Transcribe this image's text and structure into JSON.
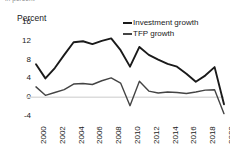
{
  "figure": {
    "clipped_caption": "in percent",
    "axis_title": "Percent",
    "background_color": "#ffffff"
  },
  "legend": {
    "position": "top-right",
    "entries": [
      {
        "label": "Investment growth",
        "color": "#1a1a1a"
      },
      {
        "label": "TFP growth",
        "color": "#444444"
      }
    ]
  },
  "chart_data": {
    "type": "line",
    "title": "",
    "subtitle": "",
    "xlabel": "",
    "ylabel": "Percent",
    "ylim": [
      -4,
      16
    ],
    "xlim": [
      2000,
      2020
    ],
    "yticks": [
      16,
      12,
      8,
      4,
      0,
      -4
    ],
    "xticks": [
      2000,
      2002,
      2004,
      2006,
      2008,
      2010,
      2012,
      2014,
      2016,
      2018,
      2020
    ],
    "grid": false,
    "zero_line": true,
    "x": [
      2000,
      2001,
      2002,
      2003,
      2004,
      2005,
      2006,
      2007,
      2008,
      2009,
      2010,
      2011,
      2012,
      2013,
      2014,
      2015,
      2016,
      2017,
      2018,
      2019,
      2020
    ],
    "series": [
      {
        "name": "Investment growth",
        "color": "#1a1a1a",
        "values": [
          7.0,
          4.0,
          6.2,
          9.0,
          11.7,
          11.9,
          11.3,
          12.0,
          12.5,
          10.0,
          6.5,
          10.7,
          9.0,
          8.0,
          7.1,
          6.5,
          5.0,
          3.3,
          4.6,
          6.4,
          -1.5
        ]
      },
      {
        "name": "TFP growth",
        "color": "#444444",
        "values": [
          2.2,
          0.4,
          1.0,
          1.6,
          2.8,
          2.9,
          2.7,
          3.5,
          4.1,
          3.0,
          -1.8,
          3.4,
          1.3,
          0.9,
          1.1,
          1.0,
          0.8,
          1.1,
          1.5,
          1.6,
          -3.5
        ]
      }
    ],
    "annotations": []
  }
}
